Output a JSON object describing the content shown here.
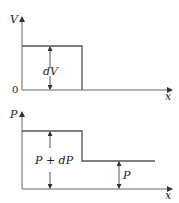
{
  "top_diagram": {
    "y_axis_label": "V",
    "x_axis_label": "x",
    "origin_label": "0",
    "annotation": "dV"
  },
  "bottom_diagram": {
    "y_axis_label": "P",
    "x_axis_label": "x",
    "high_level_annotation": "P + dP",
    "low_level_annotation": "P"
  },
  "colors": {
    "line": "#555555",
    "text": "#222222",
    "background": "#ffffff"
  }
}
